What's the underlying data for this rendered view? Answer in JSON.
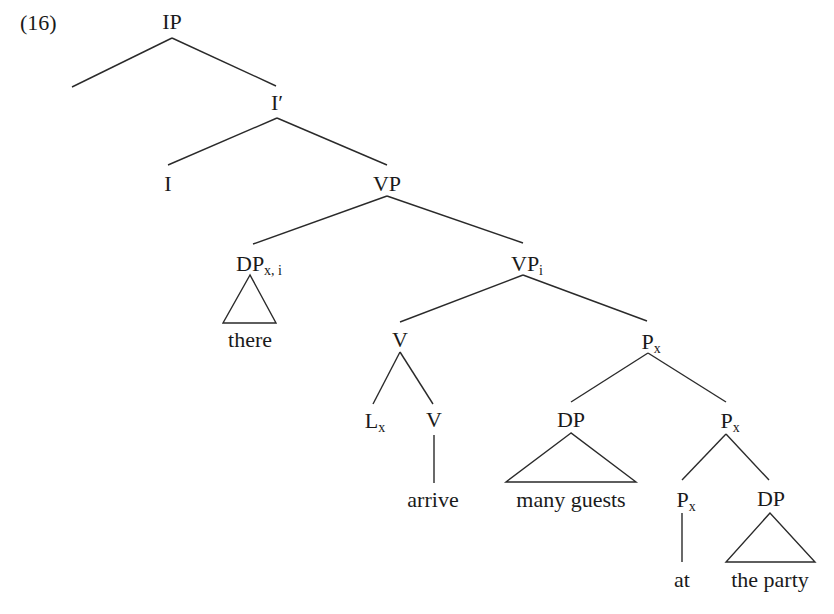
{
  "example_number": "(16)",
  "nodes": {
    "ip": {
      "label": "IP",
      "sub": ""
    },
    "ibar": {
      "label": "I′",
      "sub": ""
    },
    "i": {
      "label": "I",
      "sub": ""
    },
    "vp": {
      "label": "VP",
      "sub": ""
    },
    "dp_there": {
      "label": "DP",
      "sub": "x, i"
    },
    "vpi": {
      "label": "VP",
      "sub": "i"
    },
    "v_top": {
      "label": "V",
      "sub": ""
    },
    "lx": {
      "label": "L",
      "sub": "x"
    },
    "v_low": {
      "label": "V",
      "sub": ""
    },
    "px_top": {
      "label": "P",
      "sub": "x"
    },
    "dp_guests": {
      "label": "DP",
      "sub": ""
    },
    "px_mid": {
      "label": "P",
      "sub": "x"
    },
    "px_low": {
      "label": "P",
      "sub": "x"
    },
    "dp_party": {
      "label": "DP",
      "sub": ""
    }
  },
  "leaves": {
    "there": "there",
    "arrive": "arrive",
    "many_guests": "many guests",
    "at": "at",
    "the_party": "the party"
  },
  "colors": {
    "line": "#2a2a2a",
    "text": "#1a1a1a",
    "background": "#ffffff"
  }
}
